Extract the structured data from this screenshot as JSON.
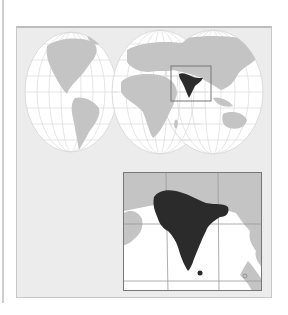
{
  "map": {
    "type": "locator-map",
    "projection": "interrupted-world",
    "highlighted_region": "India",
    "colors": {
      "background": "#ffffff",
      "panel": "#ececec",
      "ocean": "#ffffff",
      "land": "#c4c4c4",
      "graticule": "#d8d8d8",
      "highlight": "#2b2b2b",
      "inset_frame": "#777777"
    },
    "inset": {
      "label": "",
      "shows": "South Asia detail"
    }
  }
}
